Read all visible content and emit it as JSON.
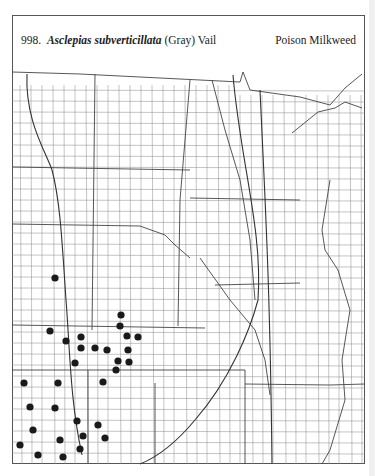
{
  "header": {
    "number": "998.",
    "species": "Asclepias subverticillata",
    "authority": "(Gray) Vail",
    "common_name": "Poison Milkweed"
  },
  "map": {
    "region": "Great Plains / Midwest county map",
    "dot_color": "#1a1a1a",
    "occurrences": [
      [
        55,
        278
      ],
      [
        121,
        315
      ],
      [
        120,
        326
      ],
      [
        50,
        331
      ],
      [
        66,
        341
      ],
      [
        81,
        337
      ],
      [
        127,
        336
      ],
      [
        138,
        337
      ],
      [
        81,
        348
      ],
      [
        95,
        348
      ],
      [
        107,
        350
      ],
      [
        128,
        350
      ],
      [
        118,
        361
      ],
      [
        129,
        362
      ],
      [
        75,
        363
      ],
      [
        116,
        370
      ],
      [
        24,
        383
      ],
      [
        58,
        383
      ],
      [
        103,
        382
      ],
      [
        30,
        407
      ],
      [
        55,
        408
      ],
      [
        77,
        421
      ],
      [
        98,
        425
      ],
      [
        33,
        430
      ],
      [
        83,
        436
      ],
      [
        105,
        438
      ],
      [
        60,
        440
      ],
      [
        20,
        445
      ],
      [
        80,
        449
      ],
      [
        38,
        455
      ],
      [
        63,
        457
      ]
    ]
  }
}
